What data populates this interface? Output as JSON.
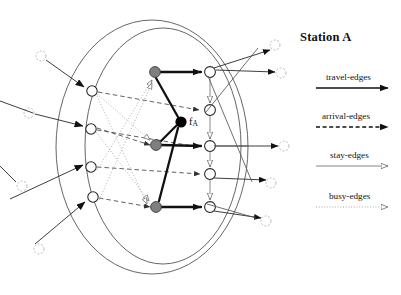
{
  "title": {
    "text": "Station A"
  },
  "diagram": {
    "center_label": "f",
    "center_label_sub": "A",
    "station_ellipses": 2,
    "node_counts": {
      "inside_left_circles": 4,
      "inside_right_circles": 5,
      "gray_nodes": 3,
      "black_node": 1,
      "outside_left_circles": 4,
      "outside_right_circles": 5
    },
    "colors": {
      "gray_node_fill": "#7f7f7f",
      "black_node_fill": "#000000",
      "hollow_node_fill": "#ffffff",
      "stroke": "#1a1a1a",
      "faint_stroke": "#9a9a9a",
      "ellipse_stroke": "#555555"
    }
  },
  "legend": {
    "items": [
      {
        "label": "travel-edges",
        "style": "solid-thick",
        "arrow": "filled"
      },
      {
        "label": "arrival-edges",
        "style": "dashed",
        "arrow": "filled"
      },
      {
        "label": "stay-edges",
        "style": "solid-thin",
        "arrow": "hollow"
      },
      {
        "label": "busy-edges",
        "style": "dotted",
        "arrow": "hollow"
      }
    ]
  }
}
